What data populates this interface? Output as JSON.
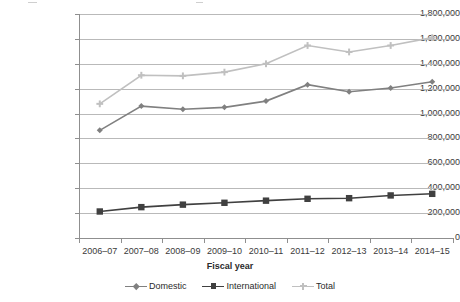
{
  "chart_data": {
    "type": "line",
    "title": "",
    "xlabel": "Fiscal year",
    "ylabel": "",
    "categories": [
      "2006–07",
      "2007–08",
      "2008–09",
      "2009–10",
      "2010–11",
      "2011–12",
      "2012–13",
      "2013–14",
      "2014–15"
    ],
    "series": [
      {
        "name": "Domestic",
        "color": "#808080",
        "marker": "diamond",
        "values": [
          865000,
          1060000,
          1035000,
          1050000,
          1100000,
          1232000,
          1175000,
          1205000,
          1255000
        ]
      },
      {
        "name": "International",
        "color": "#404040",
        "marker": "square",
        "values": [
          213000,
          248000,
          268000,
          283000,
          300000,
          315000,
          320000,
          342000,
          355000
        ]
      },
      {
        "name": "Total",
        "color": "#c0c0c0",
        "marker": "plus",
        "values": [
          1078000,
          1308000,
          1303000,
          1333000,
          1400000,
          1547000,
          1495000,
          1547000,
          1610000
        ]
      }
    ],
    "ylim": [
      0,
      1800000
    ],
    "ytick_step": 200000,
    "yticks": [
      "0",
      "200,000",
      "400,000",
      "600,000",
      "800,000",
      "1,000,000",
      "1,200,000",
      "1,400,000",
      "1,600,000",
      "1,800,000"
    ],
    "grid": true,
    "grid_axis": "y",
    "legend_position": "bottom"
  },
  "legend": {
    "items": [
      {
        "label": "Domestic",
        "color": "#808080",
        "marker": "diamond"
      },
      {
        "label": "International",
        "color": "#404040",
        "marker": "square"
      },
      {
        "label": "Total",
        "color": "#c0c0c0",
        "marker": "plus"
      }
    ]
  },
  "axis": {
    "x_title": "Fiscal year"
  }
}
